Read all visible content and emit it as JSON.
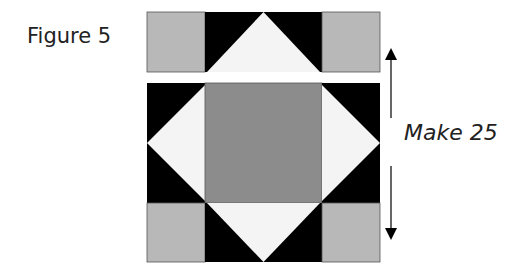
{
  "figure_label": "Figure 5",
  "quantity_label": "Make 25",
  "colors": {
    "light_gray": "#b8b8b8",
    "medium_gray": "#8c8c8c",
    "black": "#000000",
    "white_fabric": "#f4f4f4",
    "arrow": "#000000"
  },
  "blocks": [
    {
      "name": "top-row-unit",
      "description": "Row with two light gray squares and a flying-geese unit (black background, white triangle pointing up)"
    },
    {
      "name": "main-block-unit",
      "description": "Center medium gray square flanked by two square-in-square side units, with bottom row of light gray squares and flying-geese unit pointing down"
    }
  ]
}
